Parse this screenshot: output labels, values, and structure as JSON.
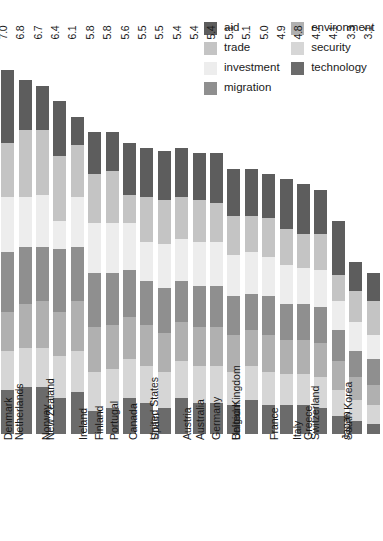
{
  "legend": {
    "column_left": [
      {
        "label": "aid",
        "color": "#5d5d5d"
      },
      {
        "label": "trade",
        "color": "#c4c4c4"
      },
      {
        "label": "investment",
        "color": "#ededed"
      },
      {
        "label": "migration",
        "color": "#8f8f8f"
      }
    ],
    "column_right": [
      {
        "label": "environment",
        "color": "#b0b0b0"
      },
      {
        "label": "security",
        "color": "#d6d6d6"
      },
      {
        "label": "technology",
        "color": "#6b6b6b"
      }
    ]
  },
  "chart_data": {
    "type": "bar",
    "title": "",
    "xlabel": "",
    "ylabel": "",
    "stacked": true,
    "orientation": "vertical",
    "grid": false,
    "legend_position": "top-right",
    "ylim": [
      0,
      7.0
    ],
    "categories": [
      "Sweden",
      "Denmark",
      "Netherlands",
      "Norway",
      "New Zealand",
      "Ireland",
      "Finland",
      "Portugal",
      "Canada",
      "Spain",
      "United States",
      "Austria",
      "Australia",
      "Germany",
      "Belgium",
      "United Kingdom",
      "France",
      "Italy",
      "Greece",
      "Switzerland",
      "Japan",
      "South Korea"
    ],
    "totals": [
      7.0,
      6.8,
      6.7,
      6.4,
      6.1,
      5.8,
      5.8,
      5.6,
      5.5,
      5.5,
      5.4,
      5.4,
      5.4,
      5.1,
      5.1,
      5.0,
      4.9,
      4.8,
      4.7,
      4.1,
      3.3,
      3.1
    ],
    "series": [
      {
        "name": "aid",
        "values": [
          1.4,
          0.95,
          0.85,
          1.05,
          0.55,
          0.8,
          0.75,
          1.0,
          0.95,
          0.95,
          0.95,
          0.9,
          0.95,
          0.9,
          0.9,
          0.85,
          0.95,
          0.95,
          0.85,
          1.05,
          0.55,
          0.55
        ]
      },
      {
        "name": "trade",
        "values": [
          1.05,
          1.3,
          1.25,
          1.25,
          1.0,
          0.95,
          1.0,
          0.55,
          0.85,
          0.85,
          0.8,
          0.8,
          0.75,
          0.75,
          0.7,
          0.75,
          0.7,
          0.65,
          0.7,
          0.5,
          0.6,
          0.65
        ]
      },
      {
        "name": "investment",
        "values": [
          1.05,
          0.95,
          1.0,
          0.55,
          0.95,
          0.95,
          0.95,
          0.9,
          0.75,
          0.85,
          0.8,
          0.85,
          0.85,
          0.8,
          0.8,
          0.75,
          0.75,
          0.7,
          0.7,
          0.55,
          0.55,
          0.45
        ]
      },
      {
        "name": "migration",
        "values": [
          1.15,
          1.1,
          1.05,
          1.2,
          1.05,
          1.05,
          1.0,
          0.9,
          0.85,
          0.85,
          0.8,
          0.8,
          0.8,
          0.75,
          0.7,
          0.75,
          0.7,
          0.7,
          0.7,
          0.6,
          0.5,
          0.5
        ]
      },
      {
        "name": "environment",
        "values": [
          0.75,
          0.85,
          0.9,
          0.85,
          0.95,
          0.85,
          0.85,
          0.8,
          0.8,
          0.75,
          0.75,
          0.75,
          0.75,
          0.7,
          0.7,
          0.7,
          0.65,
          0.65,
          0.65,
          0.55,
          0.45,
          0.4
        ]
      },
      {
        "name": "security",
        "values": [
          0.75,
          0.75,
          0.75,
          0.8,
          0.8,
          0.75,
          0.75,
          0.75,
          0.7,
          0.7,
          0.7,
          0.7,
          0.7,
          0.65,
          0.65,
          0.65,
          0.6,
          0.6,
          0.6,
          0.5,
          0.4,
          0.35
        ]
      },
      {
        "name": "technology",
        "values": [
          0.85,
          0.9,
          0.9,
          0.7,
          0.8,
          0.45,
          0.5,
          0.7,
          0.6,
          0.5,
          0.7,
          0.6,
          0.6,
          0.55,
          0.65,
          0.55,
          0.55,
          0.55,
          0.5,
          0.35,
          0.25,
          0.2
        ]
      }
    ],
    "series_colors": {
      "aid": "#5d5d5d",
      "trade": "#c4c4c4",
      "investment": "#ededed",
      "migration": "#8f8f8f",
      "environment": "#b0b0b0",
      "security": "#d6d6d6",
      "technology": "#6b6b6b"
    },
    "value_labels": [
      "7.0",
      "6.8",
      "6.7",
      "6.4",
      "6.1",
      "5.8",
      "5.8",
      "5.6",
      "5.5",
      "5.5",
      "5.4",
      "5.4",
      "5.4",
      "5.1",
      "5.1",
      "5.0",
      "4.9",
      "4.8",
      "4.7",
      "4.1",
      "3.3",
      "3.1"
    ]
  }
}
